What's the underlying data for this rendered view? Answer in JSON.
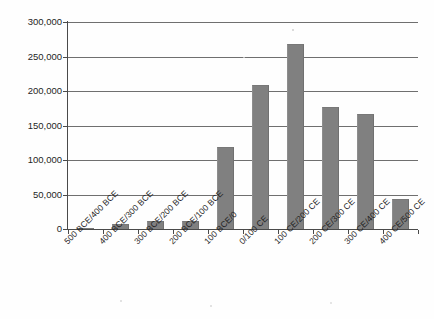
{
  "chart_data": {
    "type": "bar",
    "title": "",
    "xlabel": "",
    "ylabel": "",
    "ylim": [
      0,
      300000
    ],
    "ytick_step": 50000,
    "grid": true,
    "legend": false,
    "bar_color": "#808080",
    "categories": [
      "500 BCE/400 BCE",
      "400 BCE/300 BCE",
      "300 BCE/200 BCE",
      "200 BCE/100 BCE",
      "100 BCE/0",
      "0/100 CE",
      "100 CE/200 CE",
      "200 CE/300 CE",
      "300 CE/400 CE",
      "400 CE/500 CE"
    ],
    "values": [
      2000,
      7000,
      11000,
      12000,
      119000,
      208000,
      268000,
      177000,
      167000,
      44000
    ],
    "ytick_labels": [
      "0",
      "50,000",
      "100,000",
      "150,000",
      "200,000",
      "250,000",
      "300,000"
    ],
    "ytick_values": [
      0,
      50000,
      100000,
      150000,
      200000,
      250000,
      300000
    ]
  }
}
